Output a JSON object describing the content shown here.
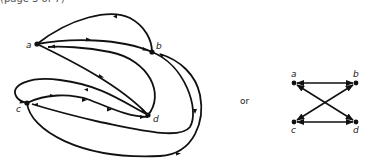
{
  "caption_fragment": "(page 3 of 7)",
  "left_graph": {
    "nodes": [
      {
        "id": "a",
        "label": "a",
        "x": 37,
        "y": 44
      },
      {
        "id": "b",
        "label": "b",
        "x": 152,
        "y": 52
      },
      {
        "id": "c",
        "label": "c",
        "x": 27,
        "y": 103
      },
      {
        "id": "d",
        "label": "d",
        "x": 148,
        "y": 115
      }
    ],
    "edge_count": 10
  },
  "separator_text": "or",
  "right_graph": {
    "nodes": [
      {
        "id": "a",
        "label": "a",
        "x": 294,
        "y": 83
      },
      {
        "id": "b",
        "label": "b",
        "x": 356,
        "y": 83
      },
      {
        "id": "c",
        "label": "c",
        "x": 294,
        "y": 122
      },
      {
        "id": "d",
        "label": "d",
        "x": 356,
        "y": 122
      }
    ],
    "edges": [
      {
        "from": "a",
        "to": "b",
        "directed": "both"
      },
      {
        "from": "c",
        "to": "d",
        "directed": "both"
      },
      {
        "from": "a",
        "to": "d",
        "directed": "both"
      },
      {
        "from": "b",
        "to": "c",
        "directed": "both"
      }
    ]
  },
  "colors": {
    "stroke": "#111111",
    "background": "#ffffff"
  }
}
